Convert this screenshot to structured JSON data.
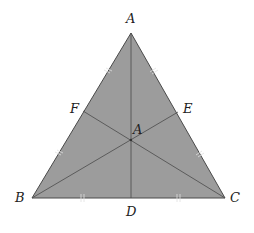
{
  "diagram": {
    "type": "triangle-medians",
    "colors": {
      "fill": "#9c9c9c",
      "stroke": "#4a4a4a",
      "label": "#222222"
    },
    "vertices": {
      "A": {
        "label": "A",
        "x": 131,
        "y": 33
      },
      "B": {
        "label": "B",
        "x": 32,
        "y": 198
      },
      "C": {
        "label": "C",
        "x": 225,
        "y": 198
      }
    },
    "midpoints": {
      "D": {
        "label": "D",
        "x": 131,
        "y": 198
      },
      "E": {
        "label": "E",
        "x": 178,
        "y": 115
      },
      "F": {
        "label": "F",
        "x": 83,
        "y": 113
      }
    },
    "centroid": {
      "label": "A",
      "x": 131,
      "y": 140
    },
    "labels": {
      "A_top": "A",
      "B": "B",
      "C": "C",
      "D": "D",
      "E": "E",
      "F": "F",
      "centroid": "A"
    }
  }
}
